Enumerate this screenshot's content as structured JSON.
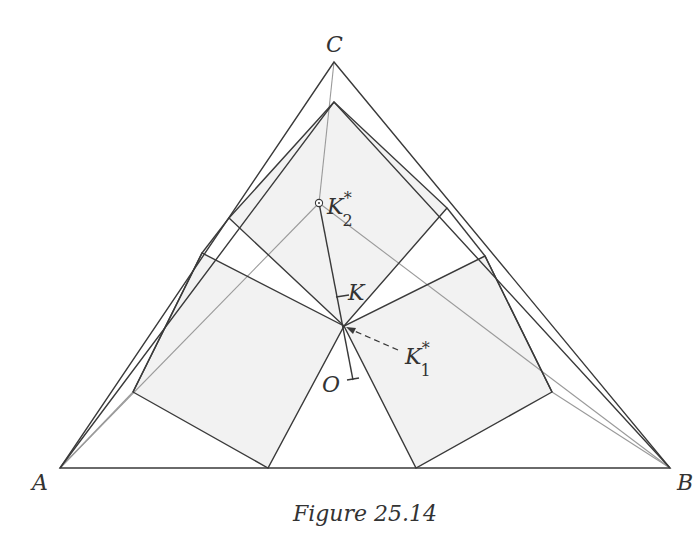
{
  "figure": {
    "caption": "Figure 25.14",
    "colors": {
      "line": "#3a3a3a",
      "thin_line": "#9a9a9a",
      "fill": "#f1f1f1",
      "text": "#333333"
    },
    "points": {
      "A": {
        "label": "A",
        "x": 60,
        "y": 468
      },
      "B": {
        "label": "B",
        "x": 670,
        "y": 468
      },
      "C": {
        "label": "C",
        "x": 334,
        "y": 62
      },
      "K": {
        "label": "K"
      },
      "K1": {
        "label": "K",
        "sub": "1",
        "sup": "*"
      },
      "K2": {
        "label": "K",
        "sub": "2",
        "sup": "*"
      },
      "O": {
        "label": "O"
      }
    }
  }
}
